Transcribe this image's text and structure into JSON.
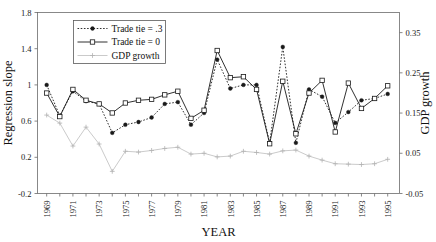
{
  "chart_data": {
    "type": "line",
    "title": "",
    "xlabel": "YEAR",
    "ylabel": "Regression slope",
    "ylabel_secondary": "GDP growth",
    "grid": false,
    "legend_position": "top-left-inside",
    "x": [
      1969,
      1970,
      1971,
      1972,
      1973,
      1974,
      1975,
      1976,
      1977,
      1978,
      1979,
      1980,
      1981,
      1982,
      1983,
      1984,
      1985,
      1986,
      1987,
      1988,
      1989,
      1990,
      1991,
      1992,
      1993,
      1994,
      1995
    ],
    "xtick_labels": [
      "1969",
      "1971",
      "1973",
      "1975",
      "1977",
      "1979",
      "1981",
      "1983",
      "1985",
      "1987",
      "1989",
      "1991",
      "1993",
      "1995"
    ],
    "xtick_values": [
      1969,
      1971,
      1973,
      1975,
      1977,
      1979,
      1981,
      1983,
      1985,
      1987,
      1989,
      1991,
      1993,
      1995
    ],
    "xlim": [
      1968.3,
      1995.9
    ],
    "ylim": [
      -0.2,
      1.8
    ],
    "ytick_labels": [
      "1.8",
      "1.4",
      "1",
      "0.6",
      "0.2",
      "-0.2"
    ],
    "ytick_values": [
      1.8,
      1.4,
      1.0,
      0.6,
      0.2,
      -0.2
    ],
    "ylim_secondary": [
      -0.05,
      0.4
    ],
    "ytick_labels_secondary": [
      "0.35",
      "0.25",
      "0.15",
      "0.05",
      "-0.05"
    ],
    "ytick_values_secondary": [
      0.35,
      0.25,
      0.15,
      0.05,
      -0.05
    ],
    "series": [
      {
        "name": "Trade tie = .3",
        "axis": "left",
        "line_style": "dotted",
        "marker": "filled-circle",
        "color": "#1a1a1a",
        "values": [
          1.0,
          0.66,
          0.93,
          0.82,
          0.79,
          0.47,
          0.56,
          0.59,
          0.64,
          0.79,
          0.81,
          0.56,
          0.69,
          1.28,
          0.96,
          1.0,
          1.0,
          0.36,
          1.42,
          0.36,
          0.95,
          0.87,
          0.58,
          0.7,
          0.83,
          0.85,
          0.9
        ]
      },
      {
        "name": "Trade tie = 0",
        "axis": "left",
        "line_style": "solid",
        "marker": "open-square",
        "color": "#1a1a1a",
        "values": [
          0.91,
          0.65,
          0.95,
          0.83,
          0.79,
          0.69,
          0.8,
          0.83,
          0.84,
          0.89,
          0.93,
          0.63,
          0.72,
          1.38,
          1.08,
          1.09,
          0.95,
          0.35,
          1.04,
          0.46,
          0.91,
          1.05,
          0.48,
          1.02,
          0.74,
          0.85,
          0.99
        ]
      },
      {
        "name": "GDP growth",
        "axis": "right",
        "line_style": "solid-light",
        "marker": "plus",
        "color": "#b3b3b3",
        "values": [
          0.145,
          0.125,
          0.068,
          0.115,
          0.073,
          0.005,
          0.055,
          0.053,
          0.057,
          0.062,
          0.065,
          0.048,
          0.05,
          0.041,
          0.043,
          0.055,
          0.052,
          0.048,
          0.056,
          0.058,
          0.043,
          0.033,
          0.024,
          0.023,
          0.022,
          0.024,
          0.035
        ]
      }
    ]
  },
  "legend": {
    "items": [
      {
        "label": "Trade tie = .3"
      },
      {
        "label": "Trade tie = 0"
      },
      {
        "label": "GDP growth"
      }
    ]
  },
  "axes": {
    "left_title": "Regression slope",
    "right_title": "GDP growth",
    "bottom_title": "YEAR"
  }
}
